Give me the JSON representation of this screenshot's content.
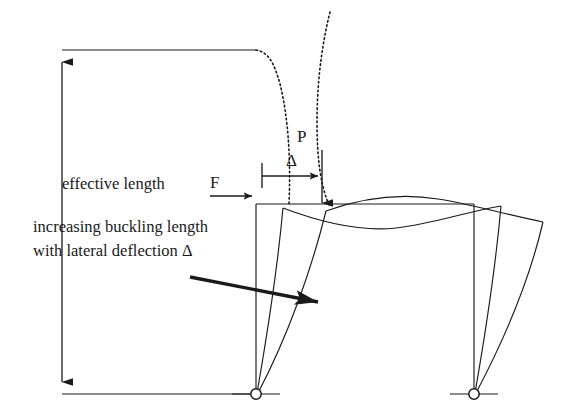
{
  "figure": {
    "background_color": "#ffffff",
    "line_color": "#1a1a1a",
    "dotted_color": "#1a1a1a"
  },
  "labels": {
    "effective_length": "effective length",
    "increasing_line1": "increasing buckling length",
    "increasing_line2": "with lateral deflection Δ",
    "axial_load": "P",
    "lateral_load": "F",
    "deflection": "Δ"
  },
  "icons": {
    "dimension_arrow_up": "arrow-up-icon",
    "dimension_arrow_down": "arrow-down-icon",
    "load_arrow_down": "arrow-down-icon",
    "load_arrow_right": "arrow-right-icon",
    "deflection_arrow_right": "arrow-right-icon",
    "callout_arrow": "arrow-diagonal-icon",
    "pin_support": "pin-support-icon"
  },
  "geometry": {
    "frame": {
      "beam_level_y": 204,
      "base_y": 394,
      "left_column_x": 256,
      "right_column_x": 474,
      "column_height": 190
    },
    "deflected_states": [
      {
        "name": "undeflected",
        "left_top_x": 256,
        "right_top_x": 474
      },
      {
        "name": "intermediate",
        "left_top_x": 283,
        "right_top_x": 501
      },
      {
        "name": "large-sway",
        "left_top_x": 325,
        "right_top_x": 543
      }
    ],
    "dimension_line_x": 62,
    "dimension_top_y": 50,
    "dimension_bottom_y": 394,
    "axial_load_x": 322,
    "lateral_load_y": 196,
    "deflection_tick_x": 262,
    "deflection_arrow_end_x": 318
  }
}
